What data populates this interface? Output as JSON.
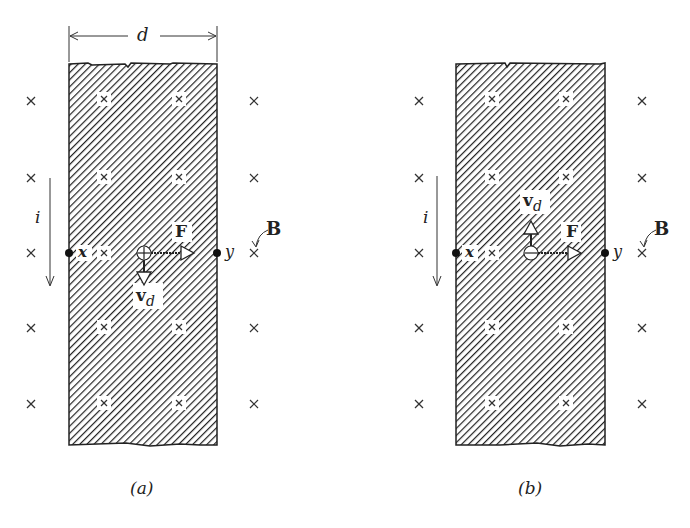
{
  "figure": {
    "panels": [
      {
        "id": "a",
        "caption": "(a)",
        "width_label": "d",
        "current_label": "i",
        "point_left_label": "x",
        "point_right_label": "y",
        "force_label": "F",
        "velocity_label": "v",
        "velocity_subscript": "d",
        "field_label": "B",
        "carrier_sign": "+",
        "carrier_symbol": "⊕",
        "drift_direction": "down",
        "force_direction": "right"
      },
      {
        "id": "b",
        "caption": "(b)",
        "current_label": "i",
        "point_left_label": "x",
        "point_right_label": "y",
        "force_label": "F",
        "velocity_label": "v",
        "velocity_subscript": "d",
        "field_label": "B",
        "carrier_sign": "−",
        "carrier_symbol": "⊖",
        "drift_direction": "up",
        "force_direction": "right"
      }
    ],
    "field_marker": "×",
    "field_direction": "into page",
    "colors": {
      "ink": "#222222",
      "background": "#ffffff"
    }
  }
}
